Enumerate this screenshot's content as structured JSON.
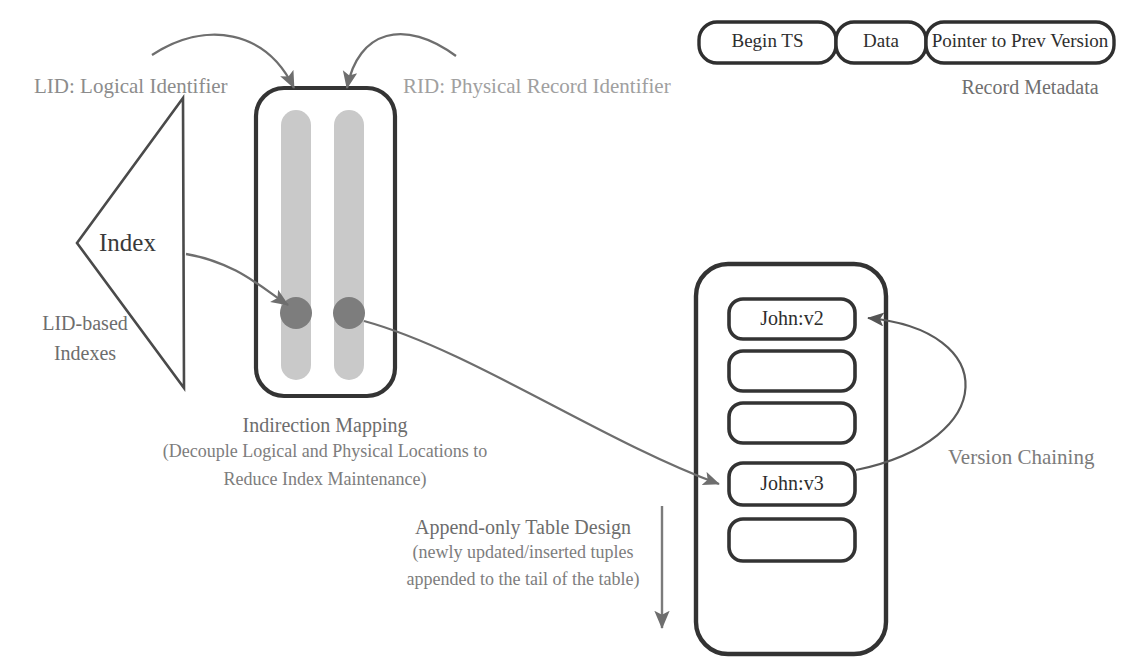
{
  "diagram": {
    "colors": {
      "ink": "#3c3c3c",
      "muted_text": "#8c8c8c",
      "column_fill": "#c9c9c9",
      "dot_fill": "#7d7d7d",
      "arrow": "#6e6e6e",
      "box_stroke": "#3a3a3a",
      "background": "#ffffff"
    }
  },
  "record_metadata": {
    "caption": "Record Metadata",
    "segments": [
      {
        "label": "Begin TS"
      },
      {
        "label": "Data"
      },
      {
        "label": "Pointer to Prev Version"
      }
    ]
  },
  "index": {
    "shape_label": "Index",
    "caption_line1": "LID-based",
    "caption_line2": "Indexes"
  },
  "annotations": {
    "lid": "LID: Logical Identifier",
    "rid": "RID: Physical Record Identifier",
    "version_chaining": "Version Chaining"
  },
  "indirection": {
    "caption_line1": "Indirection Mapping",
    "caption_line2": "(Decouple Logical and Physical Locations to",
    "caption_line3": "Reduce Index Maintenance)",
    "columns": [
      {
        "name": "lid-column",
        "has_dot": true
      },
      {
        "name": "rid-column",
        "has_dot": true
      }
    ]
  },
  "table": {
    "caption_line1": "Append-only Table Design",
    "caption_line2": "(newly updated/inserted tuples",
    "caption_line3": "appended to the tail of the table)",
    "slots": [
      {
        "label": "John:v2"
      },
      {
        "label": ""
      },
      {
        "label": ""
      },
      {
        "label": "John:v3"
      },
      {
        "label": ""
      }
    ]
  }
}
